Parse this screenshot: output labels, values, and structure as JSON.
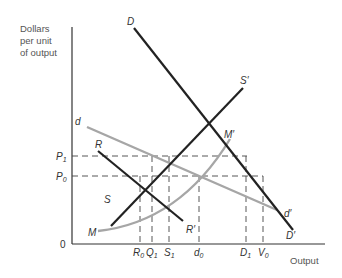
{
  "diagram": {
    "y_axis_title": [
      "Dollars",
      "per unit",
      "of output"
    ],
    "x_axis_title": "Output",
    "origin_label": "0",
    "price_levels": [
      {
        "id": "P1",
        "label": "P",
        "sub": "1"
      },
      {
        "id": "P0",
        "label": "P",
        "sub": "0"
      }
    ],
    "quantity_levels": [
      {
        "id": "R0",
        "label": "R",
        "sub": "0"
      },
      {
        "id": "Q1",
        "label": "Q",
        "sub": "1"
      },
      {
        "id": "S1",
        "label": "S",
        "sub": "1"
      },
      {
        "id": "d0",
        "label": "d",
        "sub": "0"
      },
      {
        "id": "D1",
        "label": "D",
        "sub": "1"
      },
      {
        "id": "V0",
        "label": "V",
        "sub": "0"
      }
    ],
    "curves": [
      {
        "id": "DD",
        "start_label": "D",
        "end_label": "D′",
        "color": "#222222",
        "style": "dark"
      },
      {
        "id": "SS",
        "start_label": "S",
        "end_label": "S′",
        "color": "#222222",
        "style": "dark"
      },
      {
        "id": "RR",
        "start_label": "R",
        "end_label": "R′",
        "color": "#222222",
        "style": "dark"
      },
      {
        "id": "dd",
        "start_label": "d",
        "end_label": "d′",
        "color": "#a6a6a6",
        "style": "gray"
      },
      {
        "id": "MM",
        "start_label": "M",
        "end_label": "M′",
        "color": "#a6a6a6",
        "style": "gray"
      }
    ],
    "colors": {
      "dark_line": "#222222",
      "gray_line": "#a6a6a6",
      "dashed_line": "#444444",
      "axis": "#333333"
    }
  }
}
